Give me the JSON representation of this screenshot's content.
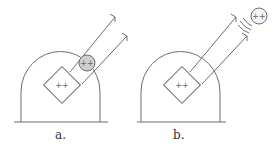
{
  "panels": [
    {
      "id": "a",
      "caption": "a.",
      "charge_box_label": "++",
      "sphere_label": "++",
      "sphere_state": "attached"
    },
    {
      "id": "b",
      "caption": "b.",
      "charge_box_label": "++",
      "sphere_label": "++",
      "sphere_state": "ejected"
    }
  ]
}
